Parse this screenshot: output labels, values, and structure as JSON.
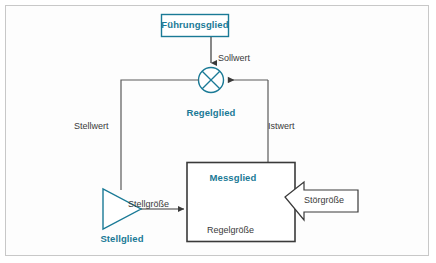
{
  "diagram": {
    "colors": {
      "accent_teal": "#1a7a96",
      "block_border_dark": "#3a3a3a",
      "line_gray": "#5a5a5a",
      "frame_border": "#c8c8c8",
      "background": "#fdfdfd"
    },
    "blocks": [
      {
        "id": "fuehrungsglied",
        "label": "Führungsglied",
        "shape": "rectangle",
        "style": "teal-outline"
      },
      {
        "id": "regelglied",
        "label": "Regelglied",
        "shape": "circle-with-x",
        "style": "teal-outline"
      },
      {
        "id": "messglied",
        "label": "Messglied",
        "shape": "rectangle",
        "style": "dark-outline"
      },
      {
        "id": "stellglied",
        "label": "Stellglied",
        "shape": "triangle-right",
        "style": "teal-outline"
      }
    ],
    "signals": [
      {
        "id": "sollwert",
        "label": "Sollwert"
      },
      {
        "id": "stellwert",
        "label": "Stellwert"
      },
      {
        "id": "istwert",
        "label": "Istwert"
      },
      {
        "id": "stellgroesse",
        "label": "Stellgröße"
      },
      {
        "id": "regelgroesse",
        "label": "Regelgröße"
      },
      {
        "id": "stoergroesse",
        "label": "Störgröße",
        "shape": "block-arrow-left"
      }
    ]
  }
}
